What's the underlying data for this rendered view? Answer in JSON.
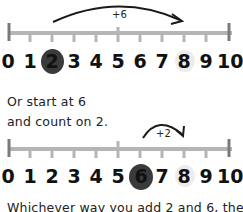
{
  "colors": {
    "line": "#b5b5b5",
    "end_bar": "#7a7a7a",
    "start_circle": "#3a3a3a",
    "end_circle": "#ececec",
    "arrow": "#1a1a1a"
  },
  "number_line_1": {
    "labels": [
      "0",
      "1",
      "2",
      "3",
      "4",
      "5",
      "6",
      "7",
      "8",
      "9",
      "10"
    ],
    "start": 2,
    "end": 8,
    "jump_label": "+6"
  },
  "caption": {
    "line1": "Or start at 6",
    "line2": "and count on 2."
  },
  "number_line_2": {
    "labels": [
      "0",
      "1",
      "2",
      "3",
      "4",
      "5",
      "6",
      "7",
      "8",
      "9",
      "10"
    ],
    "start": 6,
    "end": 8,
    "jump_label": "+2"
  },
  "footer_text": "Whichever way you add 2 and 6, the"
}
